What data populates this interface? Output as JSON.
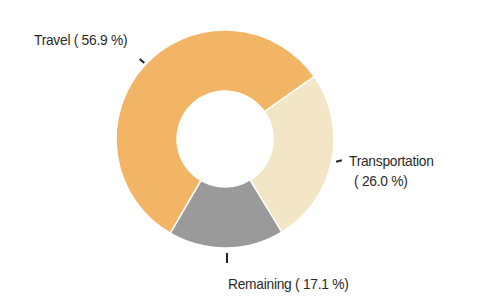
{
  "chart_data": {
    "type": "pie",
    "variant": "donut",
    "title": "",
    "categories": [
      "Travel",
      "Transportation",
      "Remaining"
    ],
    "values": [
      56.9,
      26.0,
      17.1
    ],
    "unit": "%",
    "colors": [
      "#F2B566",
      "#F3E6C6",
      "#9A9A9A"
    ],
    "labels": [
      {
        "text": "Travel ( 56.9 %)",
        "line1": "Travel ( 56.9 %)",
        "line2": ""
      },
      {
        "text": "Transportation ( 26.0 %)",
        "line1": "Transportation",
        "line2": "( 26.0 %)"
      },
      {
        "text": "Remaining ( 17.1 %)",
        "line1": "Remaining ( 17.1 %)",
        "line2": ""
      }
    ],
    "legend": "none",
    "start_angle_deg": 55,
    "direction": "clockwise",
    "inner_radius_ratio": 0.44
  },
  "labels": {
    "travel": "Travel ( 56.9 %)",
    "transportation_line1": "Transportation",
    "transportation_line2": "( 26.0 %)",
    "remaining": "Remaining ( 17.1 %)"
  }
}
